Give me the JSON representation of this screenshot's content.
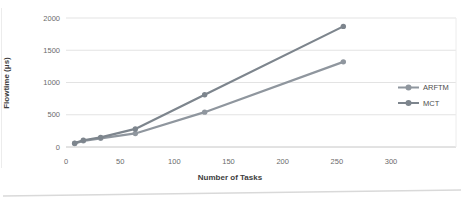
{
  "chart_data": {
    "type": "line",
    "title": "",
    "xlabel": "Number of Tasks",
    "ylabel": "Flowtime (μs)",
    "x": [
      8,
      16,
      32,
      64,
      128,
      256
    ],
    "series": [
      {
        "name": "ARFTM",
        "color": "#8f969e",
        "values": [
          55,
          95,
          135,
          210,
          540,
          1320
        ]
      },
      {
        "name": "MCT",
        "color": "#7d858d",
        "values": [
          60,
          105,
          150,
          280,
          810,
          1870
        ]
      }
    ],
    "x_ticks": [
      0,
      50,
      100,
      150,
      200,
      250,
      300
    ],
    "y_ticks": [
      0,
      500,
      1000,
      1500,
      2000
    ],
    "xlim": [
      0,
      360
    ],
    "ylim": [
      0,
      2000
    ],
    "grid": true,
    "legend_position": "right-middle",
    "marker": "circle"
  },
  "colors": {
    "background": "#ffffff",
    "gridline": "#e3e3e3",
    "axis_line": "#c6c6c6",
    "tick_text": "#6b6b6b",
    "axis_label_text": "#3d3d3d",
    "legend_text": "#4d4d4d",
    "scan_artifact": "#d9d9d9",
    "edge_artifact": "#ececec"
  }
}
